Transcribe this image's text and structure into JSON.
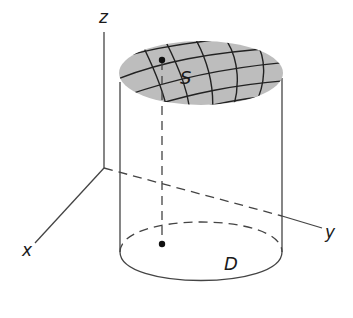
{
  "diagram": {
    "labels": {
      "z_axis": "z",
      "x_axis": "x",
      "y_axis": "y",
      "surface": "S",
      "region": "D"
    },
    "colors": {
      "surface_fill": "#bdbdbd",
      "line": "#333333",
      "background": "#ffffff"
    }
  }
}
